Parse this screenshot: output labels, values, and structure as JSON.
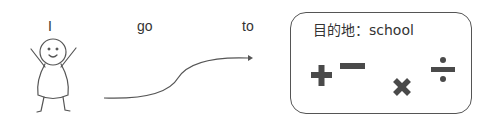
{
  "sentence": {
    "subject": "I",
    "verb": "go",
    "preposition": "to"
  },
  "destination": {
    "label": "目的地：school"
  },
  "icons": {
    "figure": "stick-figure-icon",
    "arrow": "curved-arrow-icon",
    "operators": [
      "plus-icon",
      "minus-icon",
      "times-icon",
      "divide-icon"
    ]
  },
  "colors": {
    "line": "#555555",
    "symbol": "#4a4a4a",
    "text": "#333333"
  }
}
